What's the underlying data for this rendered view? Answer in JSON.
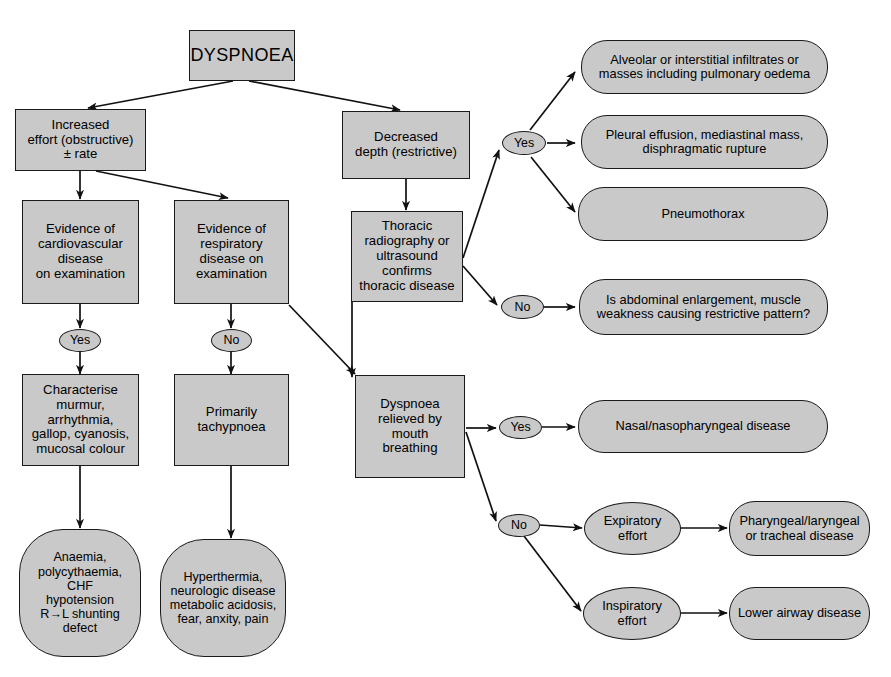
{
  "figure": {
    "title": "DYSPNOEA",
    "caption": ""
  },
  "nodes": {
    "dyspnoea": {
      "label": "DYSPNOEA",
      "shape": "rect"
    },
    "increased_effort": {
      "label": "Increased\neffort (obstructive)\n± rate",
      "shape": "rect"
    },
    "decreased_depth": {
      "label": "Decreased\ndepth (restrictive)",
      "shape": "rect"
    },
    "evidence_cardio": {
      "label": "Evidence of\ncardiovascular\ndisease\non examination",
      "shape": "rect"
    },
    "evidence_resp": {
      "label": "Evidence of\nrespiratory\ndisease on\nexamination",
      "shape": "rect"
    },
    "thoracic_imaging": {
      "label": "Thoracic\nradiography or\nultrasound\nconfirms\nthoracic disease",
      "shape": "rect"
    },
    "characterise": {
      "label": "Characterise\nmurmur,\narrhythmia,\ngallop, cyanosis,\nmucosal colour",
      "shape": "rect"
    },
    "primarily_tachypnoea": {
      "label": "Primarily\ntachypnoea",
      "shape": "rect"
    },
    "dyspnoea_mouth": {
      "label": "Dyspnoea\nrelieved by\nmouth\nbreathing",
      "shape": "rect"
    },
    "anaemia_outcome": {
      "label": "Anaemia,\npolycythaemia,\nCHF\nhypotension\nR→L shunting\ndefect",
      "shape": "blob"
    },
    "hyperthermia_outcome": {
      "label": "Hyperthermia,\nneurologic disease\nmetabolic acidosis,\nfear, anxity, pain",
      "shape": "blob"
    },
    "alveolar": {
      "label": "Alveolar or interstitial infiltrates or\nmasses including pulmonary oedema",
      "shape": "round"
    },
    "pleural": {
      "label": "Pleural effusion, mediastinal mass,\ndisphragmatic rupture",
      "shape": "round"
    },
    "pneumothorax": {
      "label": "Pneumothorax",
      "shape": "round"
    },
    "abdominal": {
      "label": "Is abdominal enlargement, muscle\nweakness causing restrictive pattern?",
      "shape": "round"
    },
    "nasal": {
      "label": "Nasal/nasopharyngeal disease",
      "shape": "round"
    },
    "pharyngeal": {
      "label": "Pharyngeal/laryngeal\nor tracheal disease",
      "shape": "round"
    },
    "lower_airway": {
      "label": "Lower airway disease",
      "shape": "round"
    },
    "expiratory_effort": {
      "label": "Expiratory\neffort",
      "shape": "ellipse"
    },
    "inspiratory_effort": {
      "label": "Inspiratory\neffort",
      "shape": "ellipse"
    }
  },
  "decisions": {
    "cardio_yes": {
      "label": "Yes"
    },
    "resp_no": {
      "label": "No"
    },
    "thoracic_yes": {
      "label": "Yes"
    },
    "thoracic_no": {
      "label": "No"
    },
    "mouth_yes": {
      "label": "Yes"
    },
    "mouth_no": {
      "label": "No"
    }
  },
  "colors": {
    "node_fill": "#c9c9c9",
    "node_stroke": "#1a1a1a",
    "page_background": "#ffffff",
    "text": "#000000"
  }
}
